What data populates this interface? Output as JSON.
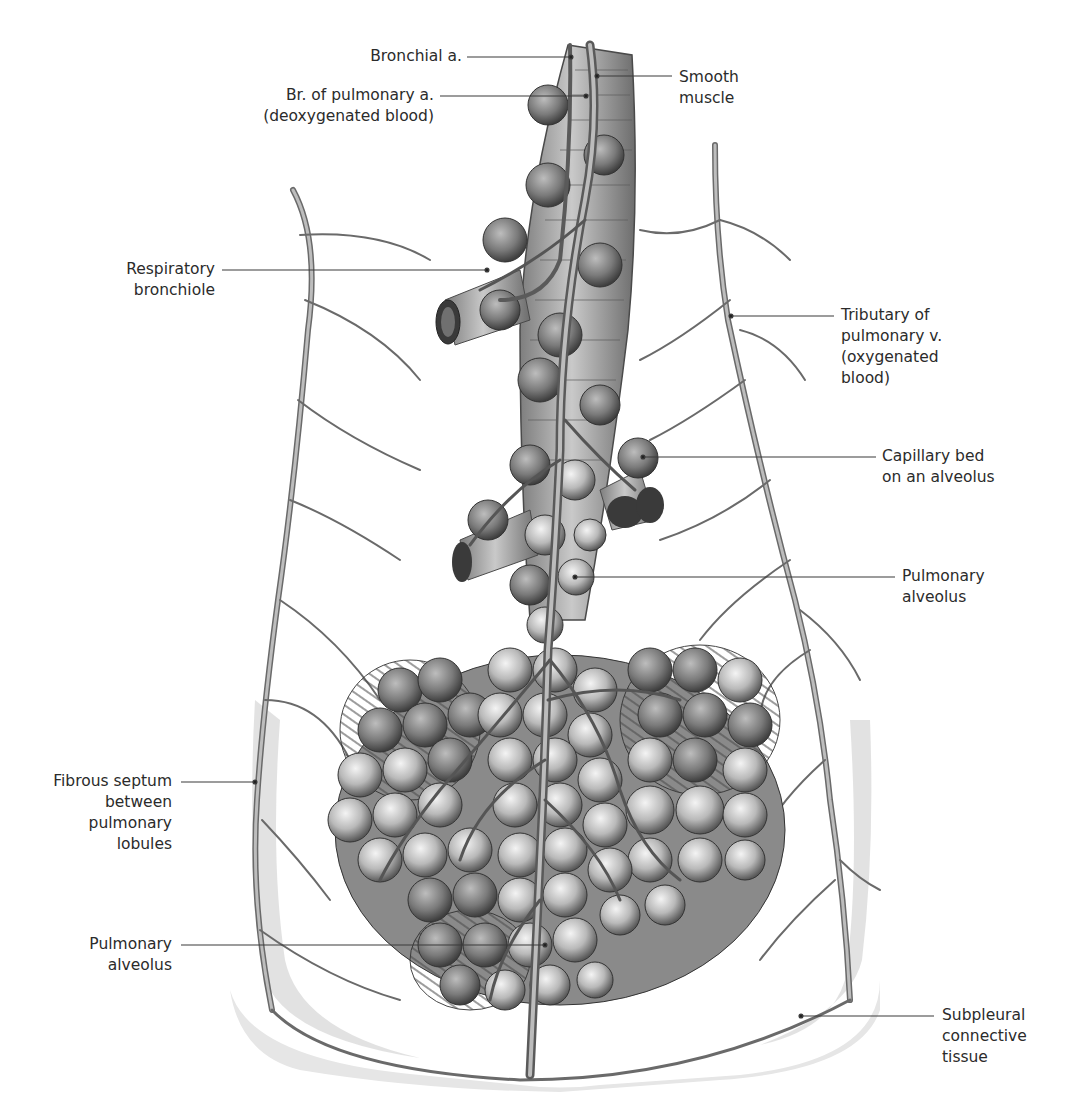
{
  "figure": {
    "background": "#ffffff",
    "ink": "#2b2b2b"
  },
  "labels": [
    {
      "id": "bronchial-artery",
      "text": "Bronchial a.",
      "x": 404,
      "y": 48,
      "w": 160,
      "align": "right",
      "line": {
        "x1": 467,
        "y1": 57,
        "x2": 571,
        "y2": 57
      }
    },
    {
      "id": "pulmonary-artery-branch",
      "text": "Br. of pulmonary a.\n(deoxygenated blood)",
      "x": 250,
      "y": 86,
      "w": 180,
      "align": "right",
      "line": {
        "x1": 440,
        "y1": 96,
        "x2": 586,
        "y2": 96
      }
    },
    {
      "id": "smooth-muscle",
      "text": "Smooth\nmuscle",
      "x": 679,
      "y": 68,
      "w": 120,
      "align": "left",
      "line": {
        "x1": 597,
        "y1": 76,
        "x2": 672,
        "y2": 76
      }
    },
    {
      "id": "respiratory-bronchiole",
      "text": "Respiratory\nbronchiole",
      "x": 110,
      "y": 258,
      "w": 115,
      "align": "right",
      "line": {
        "x1": 222,
        "y1": 270,
        "x2": 487,
        "y2": 270
      }
    },
    {
      "id": "pulmonary-vein-tributary",
      "text": "Tributary of\npulmonary v.\n(oxygenated\nblood)",
      "x": 841,
      "y": 306,
      "w": 160,
      "align": "left",
      "line": {
        "x1": 731,
        "y1": 316,
        "x2": 834,
        "y2": 316
      }
    },
    {
      "id": "capillary-bed",
      "text": "Capillary bed\non an alveolus",
      "x": 882,
      "y": 448,
      "w": 170,
      "align": "left",
      "line": {
        "x1": 643,
        "y1": 457,
        "x2": 876,
        "y2": 457
      }
    },
    {
      "id": "pulmonary-alveolus-upper",
      "text": "Pulmonary\nalveolus",
      "x": 902,
      "y": 568,
      "w": 120,
      "align": "left",
      "line": {
        "x1": 575,
        "y1": 577,
        "x2": 895,
        "y2": 577
      }
    },
    {
      "id": "fibrous-septum",
      "text": "Fibrous septum\nbetween\npulmonary\nlobules",
      "x": 20,
      "y": 770,
      "w": 152,
      "align": "right",
      "line": {
        "x1": 181,
        "y1": 782,
        "x2": 255,
        "y2": 782
      }
    },
    {
      "id": "pulmonary-alveolus-lower",
      "text": "Pulmonary\nalveolus",
      "x": 60,
      "y": 934,
      "w": 112,
      "align": "right",
      "line": {
        "x1": 181,
        "y1": 945,
        "x2": 545,
        "y2": 945
      }
    },
    {
      "id": "subpleural-connective-tissue",
      "text": "Subpleural\nconnective\ntissue",
      "x": 942,
      "y": 1006,
      "w": 120,
      "align": "left",
      "line": {
        "x1": 801,
        "y1": 1016,
        "x2": 934,
        "y2": 1016
      }
    }
  ]
}
